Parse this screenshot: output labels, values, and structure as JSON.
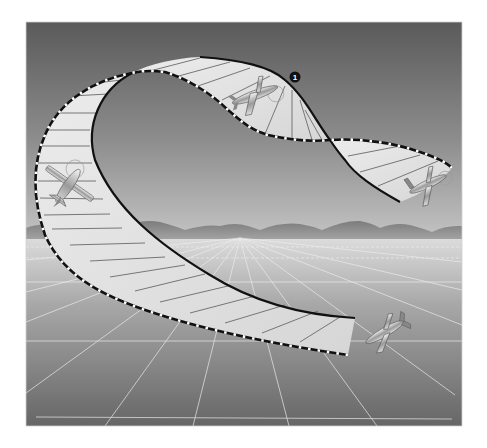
{
  "figure": {
    "title": "",
    "colors": {
      "sky_top": "#5c5c5c",
      "sky_bottom": "#bdbdbd",
      "mountains": "#8a8a8a",
      "ground_near_horizon": "#d6d6d6",
      "ground_bottom": "#6a6a6a",
      "ribbon_fill": "#e4e4e4",
      "edge_solid": "#111111",
      "edge_dashed_dark": "#111111",
      "edge_dashed_light": "#ffffff",
      "grid_lines": "#e8e8e8"
    },
    "markers": [
      {
        "id": "1",
        "label": "1"
      }
    ],
    "airplanes": [
      {
        "position": "left-vertical-descent"
      },
      {
        "position": "top-center-inverted"
      },
      {
        "position": "right-exit"
      },
      {
        "position": "bottom-right-entry"
      }
    ]
  }
}
